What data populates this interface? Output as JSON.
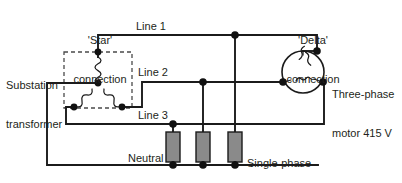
{
  "diagram": {
    "type": "electrical-schematic",
    "canvas": {
      "width": 402,
      "height": 183
    },
    "colors": {
      "background": "#ffffff",
      "wire": "#1b1b1b",
      "node": "#111111",
      "resistor_fill": "#8a8a8a",
      "dashed_outline": "#4a4a4a",
      "text": "#231f20"
    }
  },
  "labels": {
    "star_connection": {
      "line1": "'Star'",
      "line2": "connection"
    },
    "delta_connection": {
      "line1": "'Delta'",
      "line2": "connection"
    },
    "substation_transformer": {
      "line1": "Substation",
      "line2": "transformer"
    },
    "line_1": "Line 1",
    "line_2": "Line 2",
    "line_3": "Line 3",
    "neutral": "Neutral",
    "motor": {
      "line1": "Three-phase",
      "line2": "motor 415 V"
    },
    "loads": {
      "line1": "Single-phase",
      "line2": "loads 230 V"
    }
  },
  "components": {
    "transformer_windings": [
      {
        "name": "winding-phase-a",
        "orientation": "vertical",
        "turns": 5
      },
      {
        "name": "winding-phase-b",
        "orientation": "diagonal-left",
        "turns": 4
      },
      {
        "name": "winding-phase-c",
        "orientation": "diagonal-right",
        "turns": 4
      }
    ],
    "motor_windings": [
      {
        "name": "motor-winding-left",
        "turns": 3
      },
      {
        "name": "motor-winding-right",
        "turns": 3
      },
      {
        "name": "motor-winding-bottom",
        "turns": 3
      }
    ],
    "loads": [
      {
        "name": "single-phase-load-1",
        "fed_from": "Line 3"
      },
      {
        "name": "single-phase-load-2",
        "fed_from": "Line 2"
      },
      {
        "name": "single-phase-load-3",
        "fed_from": "Line 1"
      }
    ],
    "voltages": {
      "line_to_line": "415 V",
      "line_to_neutral": "230 V"
    }
  },
  "geometry": {
    "star_center": {
      "x": 98,
      "y": 83
    },
    "star_top": {
      "x": 98,
      "y": 52
    },
    "star_left": {
      "x": 74,
      "y": 107
    },
    "star_right": {
      "x": 122,
      "y": 107
    },
    "line1_y": 35,
    "line2_y": 82,
    "line3_y": 124,
    "neutral_y": 165,
    "motor_center": {
      "x": 303,
      "y": 72
    },
    "motor_radius": 21,
    "resistor_x": [
      173,
      203,
      235
    ],
    "resistor_top_y": 132,
    "resistor_bottom_y": 162
  }
}
